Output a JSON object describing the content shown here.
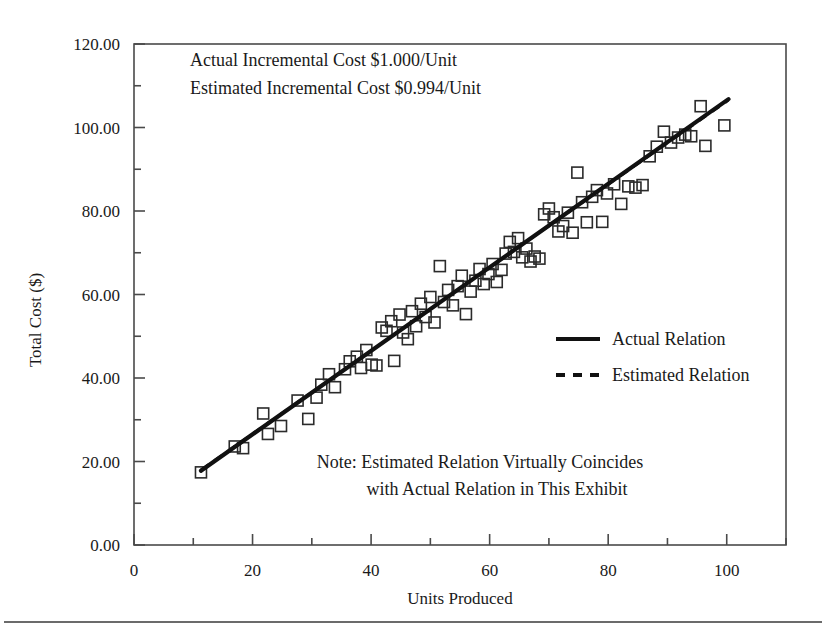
{
  "figure": {
    "background_color": "#ffffff",
    "ink_color": "#1a1a1a",
    "has_bottom_rule": true
  },
  "annotations": {
    "actual_cost_line": "Actual Incremental Cost $1.000/Unit",
    "estimated_cost_line": "Estimated Incremental Cost $0.994/Unit",
    "note_line1": "Note: Estimated Relation Virtually Coincides",
    "note_line2": "with Actual Relation in This Exhibit"
  },
  "legend": {
    "position": "middle-right",
    "entries": [
      {
        "label": "Actual Relation",
        "style": "solid",
        "color": "#111111"
      },
      {
        "label": "Estimated Relation",
        "style": "dashed",
        "color": "#111111"
      }
    ]
  },
  "chart_data": {
    "type": "scatter",
    "title": "",
    "xlabel": "Units Produced",
    "ylabel": "Total Cost ($)",
    "xlim": [
      0,
      110
    ],
    "ylim": [
      0,
      120
    ],
    "grid": false,
    "x_major_ticks": [
      0,
      20,
      40,
      60,
      80,
      100
    ],
    "x_major_tick_labels": [
      "0",
      "20",
      "40",
      "60",
      "80",
      "100"
    ],
    "x_minor_ticks": [
      10,
      30,
      50,
      70,
      90,
      110
    ],
    "y_major_ticks": [
      0,
      20,
      40,
      60,
      80,
      100,
      120
    ],
    "y_major_tick_labels": [
      "0.00",
      "20.00",
      "40.00",
      "60.00",
      "80.00",
      "100.00",
      "120.00"
    ],
    "y_minor_ticks": [
      10,
      30,
      50,
      70,
      90,
      110
    ],
    "series": [
      {
        "name": "Observations",
        "type": "scatter",
        "marker": "open-square",
        "color": "#2b2b2b",
        "points": [
          [
            11.3,
            17.4
          ],
          [
            17.0,
            23.6
          ],
          [
            18.4,
            23.2
          ],
          [
            21.8,
            31.5
          ],
          [
            22.6,
            26.6
          ],
          [
            24.8,
            28.5
          ],
          [
            27.6,
            34.6
          ],
          [
            29.4,
            30.2
          ],
          [
            30.8,
            35.3
          ],
          [
            31.6,
            38.4
          ],
          [
            32.9,
            40.9
          ],
          [
            33.9,
            37.8
          ],
          [
            35.6,
            42.1
          ],
          [
            36.4,
            44.0
          ],
          [
            37.6,
            45.1
          ],
          [
            38.3,
            42.4
          ],
          [
            39.2,
            46.7
          ],
          [
            40.1,
            43.2
          ],
          [
            40.9,
            43.0
          ],
          [
            41.8,
            52.1
          ],
          [
            42.6,
            51.3
          ],
          [
            43.4,
            53.6
          ],
          [
            43.9,
            44.1
          ],
          [
            44.8,
            55.2
          ],
          [
            45.4,
            50.9
          ],
          [
            46.2,
            49.3
          ],
          [
            46.9,
            56.0
          ],
          [
            47.6,
            52.4
          ],
          [
            48.4,
            57.8
          ],
          [
            49.2,
            54.6
          ],
          [
            50.0,
            59.4
          ],
          [
            50.7,
            53.3
          ],
          [
            51.6,
            66.8
          ],
          [
            52.3,
            58.2
          ],
          [
            53.0,
            61.1
          ],
          [
            53.8,
            57.4
          ],
          [
            54.6,
            62.0
          ],
          [
            55.3,
            64.5
          ],
          [
            56.0,
            55.3
          ],
          [
            56.8,
            60.7
          ],
          [
            57.6,
            63.3
          ],
          [
            58.3,
            66.1
          ],
          [
            59.0,
            62.5
          ],
          [
            59.8,
            64.9
          ],
          [
            60.5,
            67.3
          ],
          [
            61.2,
            63.0
          ],
          [
            62.0,
            65.9
          ],
          [
            62.7,
            69.8
          ],
          [
            63.4,
            72.6
          ],
          [
            64.1,
            70.2
          ],
          [
            64.8,
            73.5
          ],
          [
            65.5,
            68.9
          ],
          [
            66.2,
            71.0
          ],
          [
            66.9,
            67.9
          ],
          [
            67.6,
            69.1
          ],
          [
            68.4,
            68.6
          ],
          [
            69.2,
            79.2
          ],
          [
            70.0,
            80.6
          ],
          [
            70.8,
            78.5
          ],
          [
            71.6,
            75.1
          ],
          [
            72.4,
            76.4
          ],
          [
            73.2,
            79.6
          ],
          [
            74.0,
            74.8
          ],
          [
            74.8,
            89.2
          ],
          [
            75.6,
            82.1
          ],
          [
            76.4,
            77.3
          ],
          [
            77.3,
            83.4
          ],
          [
            78.1,
            85.0
          ],
          [
            79.0,
            77.4
          ],
          [
            79.8,
            84.2
          ],
          [
            81.0,
            86.4
          ],
          [
            82.2,
            81.7
          ],
          [
            83.4,
            85.9
          ],
          [
            84.6,
            85.6
          ],
          [
            85.8,
            86.2
          ],
          [
            87.0,
            93.1
          ],
          [
            88.2,
            95.4
          ],
          [
            89.4,
            99.0
          ],
          [
            90.6,
            96.4
          ],
          [
            91.8,
            97.6
          ],
          [
            93.0,
            98.3
          ],
          [
            94.0,
            97.9
          ],
          [
            95.6,
            105.1
          ],
          [
            96.4,
            95.6
          ],
          [
            99.6,
            100.5
          ]
        ]
      },
      {
        "name": "Actual Relation",
        "type": "line",
        "style": "solid",
        "color": "#111111",
        "slope": 1.0,
        "intercept": 6.5,
        "x_range": [
          11.3,
          100.3
        ],
        "description": "Actual Incremental Cost $1.000/Unit"
      },
      {
        "name": "Estimated Relation",
        "type": "line",
        "style": "dashed",
        "color": "#111111",
        "slope": 0.994,
        "intercept": 6.8,
        "x_range": [
          11.3,
          100.3
        ],
        "description": "Estimated Incremental Cost $0.994/Unit"
      }
    ]
  }
}
